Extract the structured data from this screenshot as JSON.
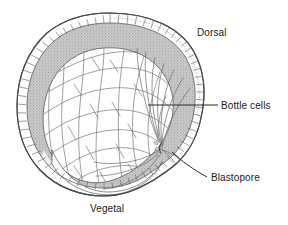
{
  "figure": {
    "background_color": "#ffffff",
    "ink_color": "#3c3c3c",
    "shade_color": "#b9b9b9",
    "width": 288,
    "height": 225
  },
  "labels": {
    "dorsal": "Dorsal",
    "bottle_cells": "Bottle cells",
    "blastopore": "Blastopore",
    "vegetal": "Vegetal"
  },
  "leaders": {
    "bottle_cells": {
      "x1": 148,
      "y1": 105,
      "x2": 218,
      "y2": 105,
      "style": "straight"
    },
    "blastopore": {
      "x1": 172,
      "y1": 152,
      "x2": 208,
      "y2": 177,
      "style": "diagonal"
    }
  },
  "structures": [
    {
      "name": "outer-epithelium",
      "description": "thin outer layer of small rectangular cells"
    },
    {
      "name": "stippled-layer",
      "description": "gray stippled subsurface region, dorsal-heavy"
    },
    {
      "name": "yolk-cell-mass",
      "description": "large polygonal endodermal yolk cells"
    },
    {
      "name": "bottle-cell-fan",
      "description": "elongated cells converging at the blastopore"
    },
    {
      "name": "blastopore-notch",
      "description": "invagination on the dorsal-ventral right margin"
    }
  ]
}
